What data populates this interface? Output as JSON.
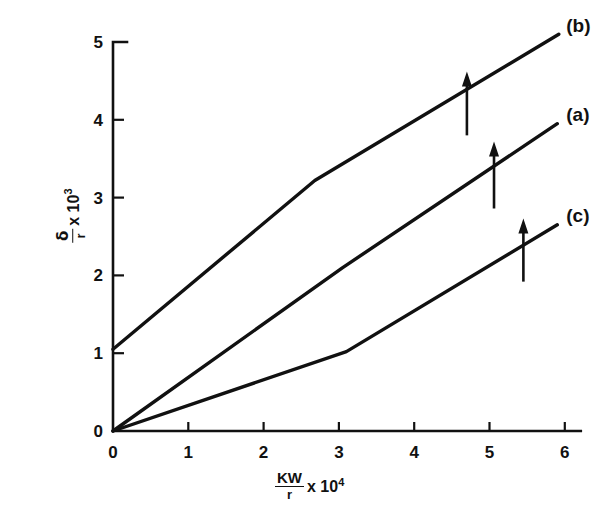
{
  "chart_data": {
    "type": "line",
    "title": "",
    "subtitle": "",
    "xlabel_parts": {
      "numerator": "KW",
      "denominator": "r",
      "multiplier": "x 10",
      "exponent": "4"
    },
    "ylabel_parts": {
      "numerator": "δ",
      "denominator": "r",
      "multiplier": "x 10",
      "exponent": "3"
    },
    "xlabel": "KW/r x 10^4",
    "ylabel": "δ/r x 10^3",
    "xlim": [
      0,
      6
    ],
    "ylim": [
      0,
      5
    ],
    "xticks": [
      0,
      1,
      2,
      3,
      4,
      5,
      6
    ],
    "yticks": [
      0,
      1,
      2,
      3,
      4,
      5
    ],
    "xticklabels": [
      "0",
      "1",
      "2",
      "3",
      "4",
      "5",
      "6"
    ],
    "yticklabels": [
      "0",
      "1",
      "2",
      "3",
      "4",
      "5"
    ],
    "grid": false,
    "legend_position": "inline-right-of-curve-ends",
    "line_color": "#111111",
    "axis_color": "#111111",
    "background_color": "#ffffff",
    "series": [
      {
        "name": "(b)",
        "label": "(b)",
        "label_x": 6.02,
        "label_y": 5.22,
        "x": [
          0.0,
          2.68,
          5.92
        ],
        "y": [
          1.05,
          3.22,
          5.1
        ],
        "arrow": {
          "x": 4.7,
          "y_base": 3.8,
          "y_tip": 4.62
        }
      },
      {
        "name": "(a)",
        "label": "(a)",
        "label_x": 6.02,
        "label_y": 4.07,
        "x": [
          0.0,
          3.05,
          5.9
        ],
        "y": [
          0.0,
          2.1,
          3.95
        ],
        "arrow": {
          "x": 5.06,
          "y_base": 2.86,
          "y_tip": 3.72
        }
      },
      {
        "name": "(c)",
        "label": "(c)",
        "label_x": 6.02,
        "label_y": 2.78,
        "x": [
          0.0,
          3.1,
          5.9
        ],
        "y": [
          0.0,
          1.02,
          2.65
        ],
        "arrow": {
          "x": 5.45,
          "y_base": 1.92,
          "y_tip": 2.73
        }
      }
    ]
  }
}
